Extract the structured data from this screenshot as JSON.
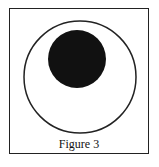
{
  "figure": {
    "caption": "Figure 3",
    "outer_circle": {
      "cx": 80,
      "cy": 77,
      "r": 56,
      "stroke": "#222222"
    },
    "inner_disc": {
      "cx": 77,
      "cy": 59,
      "r": 29,
      "fill": "#111111"
    }
  }
}
